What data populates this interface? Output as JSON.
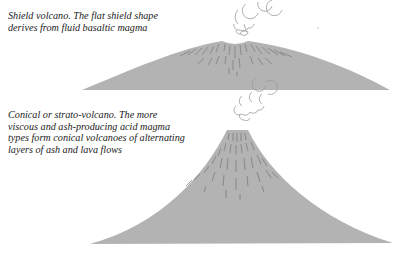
{
  "diagram": {
    "colors": {
      "volcano_fill": "#b3b3b3",
      "striation": "#707070",
      "smoke_stroke": "#9a9a9a",
      "caption_text": "#222222",
      "background": "#ffffff"
    },
    "panels": [
      {
        "id": "shield",
        "title": "Shield volcano",
        "caption_lines": [
          "Shield volcano. The flat shield shape",
          "derives from fluid basaltic magma"
        ],
        "shape": "broad low dome with summit crater",
        "icon": "shield-volcano-icon",
        "smoke_icon": "smoke-puff-icon"
      },
      {
        "id": "cone",
        "title": "Conical or strato-volcano",
        "caption_lines": [
          "Conical or strato-volcano. The more",
          "viscous and ash-producing acid magma",
          "types form conical volcanoes of alternating",
          "layers of ash and lava flows"
        ],
        "shape": "steep concave cone with flat top",
        "icon": "strato-volcano-icon",
        "smoke_icon": "smoke-puff-icon"
      }
    ]
  }
}
